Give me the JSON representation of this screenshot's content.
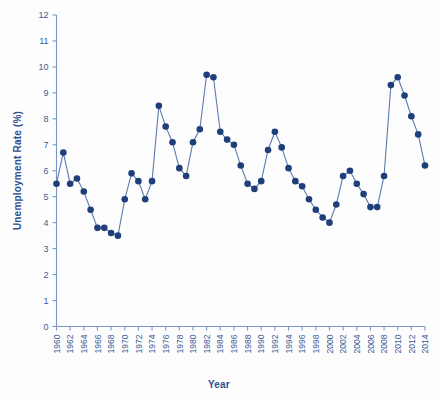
{
  "chart_data": {
    "type": "line",
    "title": "",
    "xlabel": "Year",
    "ylabel": "Unemployment Rate (%)",
    "xlim": [
      1960,
      2014
    ],
    "ylim": [
      0,
      12
    ],
    "ytick_step": 1,
    "xtick_step": 2,
    "grid": false,
    "legend": "none",
    "marker": "filled-circle",
    "series_color": "#1f3f7a",
    "line_color": "#4a6aa5",
    "x": [
      1960,
      1961,
      1962,
      1963,
      1964,
      1965,
      1966,
      1967,
      1968,
      1969,
      1970,
      1971,
      1972,
      1973,
      1974,
      1975,
      1976,
      1977,
      1978,
      1979,
      1980,
      1981,
      1982,
      1983,
      1984,
      1985,
      1986,
      1987,
      1988,
      1989,
      1990,
      1991,
      1992,
      1993,
      1994,
      1995,
      1996,
      1997,
      1998,
      1999,
      2000,
      2001,
      2002,
      2003,
      2004,
      2005,
      2006,
      2007,
      2008,
      2009,
      2010,
      2011,
      2012,
      2013,
      2014
    ],
    "values": [
      5.5,
      6.7,
      5.5,
      5.7,
      5.2,
      4.5,
      3.8,
      3.8,
      3.6,
      3.5,
      4.9,
      5.9,
      5.6,
      4.9,
      5.6,
      8.5,
      7.7,
      7.1,
      6.1,
      5.8,
      7.1,
      7.6,
      9.7,
      9.6,
      7.5,
      7.2,
      7.0,
      6.2,
      5.5,
      5.3,
      5.6,
      6.8,
      7.5,
      6.9,
      6.1,
      5.6,
      5.4,
      4.9,
      4.5,
      4.2,
      4.0,
      4.7,
      5.8,
      6.0,
      5.5,
      5.1,
      4.6,
      4.6,
      5.8,
      9.3,
      9.6,
      8.9,
      8.1,
      7.4,
      6.2
    ],
    "ytick_labels": [
      "0",
      "1",
      "2",
      "3",
      "4",
      "5",
      "6",
      "7",
      "8",
      "9",
      "10",
      "11",
      "12"
    ],
    "xtick_labels": [
      "1960",
      "1962",
      "1964",
      "1966",
      "1968",
      "1970",
      "1972",
      "1974",
      "1976",
      "1978",
      "1980",
      "1982",
      "1984",
      "1986",
      "1988",
      "1990",
      "1992",
      "1994",
      "1996",
      "1998",
      "2000",
      "2002",
      "2004",
      "2006",
      "2008",
      "2010",
      "2012",
      "2014"
    ]
  }
}
